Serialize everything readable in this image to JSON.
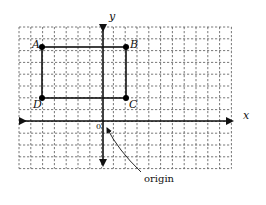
{
  "diagram": {
    "type": "coordinate-plane",
    "grid": {
      "left": 19,
      "top": 27,
      "cols": 18,
      "rows": 12,
      "cell": 11.8
    },
    "axes": {
      "x_label": "x",
      "y_label": "y",
      "origin_tick_label": "0",
      "origin_annotation": "origin"
    },
    "rectangle": {
      "vertices": [
        {
          "label": "A",
          "position": "top-left"
        },
        {
          "label": "B",
          "position": "top-right"
        },
        {
          "label": "C",
          "position": "bottom-right"
        },
        {
          "label": "D",
          "position": "bottom-left"
        }
      ]
    },
    "colors": {
      "ink": "#111111",
      "grid": "#555555",
      "background": "#ffffff"
    }
  }
}
